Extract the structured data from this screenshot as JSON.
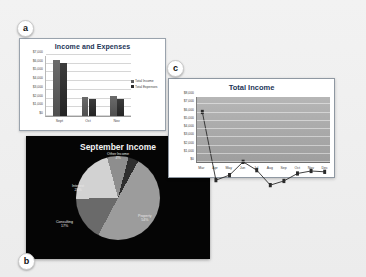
{
  "figure": {
    "background_color": "#efefef",
    "panel_labels": {
      "a": "a",
      "b": "b",
      "c": "c"
    }
  },
  "chart_data": [
    {
      "panel": "a",
      "type": "bar",
      "title": "Income and Expenses",
      "categories": [
        "Sept",
        "Oct",
        "Nov"
      ],
      "series": [
        {
          "name": "Total Income",
          "values": [
            6450,
            2150,
            2250
          ],
          "color": "#5d5d5d"
        },
        {
          "name": "Total Expenses",
          "values": [
            6050,
            1900,
            1950
          ],
          "color": "#2a2a2a"
        }
      ],
      "ylabel": "",
      "xlabel": "",
      "ylim": [
        0,
        7000
      ],
      "yticks": [
        "$0",
        "$1,000",
        "$2,000",
        "$3,000",
        "$4,000",
        "$5,000",
        "$6,000",
        "$7,000"
      ],
      "ytick_values": [
        0,
        1000,
        2000,
        3000,
        4000,
        5000,
        6000,
        7000
      ],
      "grid": true,
      "legend_position": "right",
      "plot_background": "#ffffff"
    },
    {
      "panel": "b",
      "type": "pie",
      "title": "September Income",
      "labels": [
        "Property",
        "Consulting",
        "Interest",
        "Other Income"
      ],
      "values": [
        54,
        17,
        25,
        4
      ],
      "slice_text": [
        {
          "name": "Property",
          "pct": "54%",
          "color": "#9c9c9c"
        },
        {
          "name": "Consulting",
          "pct": "17%",
          "color": "#6a6a6a"
        },
        {
          "name": "Interest",
          "pct": "25%",
          "color": "#d2d2d2"
        },
        {
          "name": "Other Income",
          "pct": "4%",
          "color": "#2e2e2e"
        }
      ],
      "plot_background": "#050505",
      "text_color": "#e8e8e8",
      "legend_position": "none"
    },
    {
      "panel": "c",
      "type": "line",
      "title": "Total Income",
      "categories": [
        "Mar",
        "Apr",
        "May",
        "Jun",
        "Jul",
        "Aug",
        "Sep",
        "Oct",
        "Nov",
        "Dec"
      ],
      "series": [
        {
          "name": "Total Income",
          "values": [
            7100,
            3000,
            3300,
            4100,
            3600,
            2700,
            2950,
            3400,
            3550,
            3500
          ],
          "color": "#2b2b2b"
        }
      ],
      "ylabel": "",
      "xlabel": "",
      "ylim": [
        0,
        8000
      ],
      "yticks": [
        "$0",
        "$1,000",
        "$2,000",
        "$3,000",
        "$4,000",
        "$5,000",
        "$6,000",
        "$7,000",
        "$8,000"
      ],
      "ytick_values": [
        0,
        1000,
        2000,
        3000,
        4000,
        5000,
        6000,
        7000,
        8000
      ],
      "grid": true,
      "markers": true,
      "legend_position": "none",
      "plot_background": "#a8a8a8"
    }
  ]
}
